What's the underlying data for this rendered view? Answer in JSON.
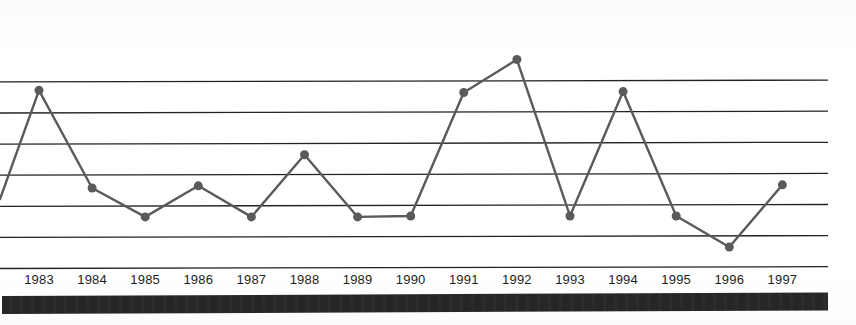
{
  "chart_data": {
    "type": "line",
    "title": "",
    "subtitle": "",
    "xlabel": "",
    "ylabel": "",
    "categories": [
      "1983",
      "1984",
      "1985",
      "1986",
      "1987",
      "1988",
      "1989",
      "1990",
      "1991",
      "1992",
      "1993",
      "1994",
      "1995",
      "1996",
      "1997"
    ],
    "values": [
      5.7,
      2.56,
      1.63,
      2.63,
      1.63,
      3.63,
      1.63,
      1.66,
      5.63,
      6.69,
      1.66,
      5.66,
      1.66,
      0.66,
      2.66
    ],
    "series": [
      {
        "name": "series-1",
        "values": [
          5.7,
          2.56,
          1.63,
          2.63,
          1.63,
          3.63,
          1.63,
          1.66,
          5.63,
          6.69,
          1.66,
          5.66,
          1.66,
          0.66,
          2.66
        ]
      }
    ],
    "leading_edge_value": 2.2,
    "ylim": [
      0,
      6.99
    ],
    "yticks": [
      0,
      1,
      2,
      3,
      4,
      5,
      6
    ],
    "ytick_labels": [
      "",
      "",
      "",
      "",
      "",
      "",
      ""
    ],
    "grid": true,
    "grid_orientation": "horizontal",
    "grid_line_count": 7,
    "legend": false,
    "legend_position": "none",
    "marker": "circle",
    "marker_size_px": 9,
    "line_width_px": 2.4,
    "annotations": []
  },
  "style": {
    "line_color": "#5a5a5a",
    "marker_color": "#5a5a5a",
    "grid_color": "#232323",
    "axis_label_color": "#1d1d1d",
    "background_color": "#ffffff",
    "footer_bar_color": "#262626"
  },
  "footer": {
    "bar_label": ""
  }
}
